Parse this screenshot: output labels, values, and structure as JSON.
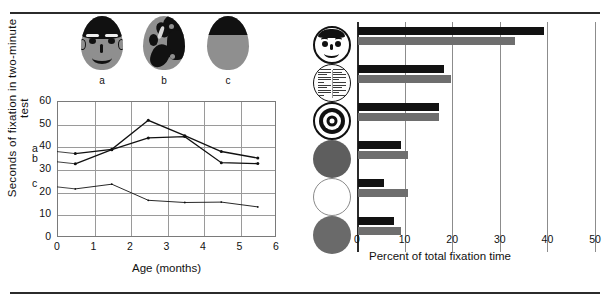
{
  "figure": {
    "left_panel": {
      "stimuli": [
        {
          "id": "a",
          "label": "a",
          "name": "schematic-face"
        },
        {
          "id": "b",
          "label": "b",
          "name": "scrambled-face"
        },
        {
          "id": "c",
          "label": "c",
          "name": "half-black-oval"
        }
      ],
      "series_tags": [
        "a",
        "b",
        "c"
      ]
    },
    "right_panel": {
      "stimuli": [
        {
          "label": "face",
          "name": "line-drawing-face"
        },
        {
          "label": "newsprint",
          "name": "newsprint-circle"
        },
        {
          "label": "bullseye",
          "name": "bullseye-circle"
        },
        {
          "label": "red",
          "name": "plain-red-circle"
        },
        {
          "label": "white",
          "name": "plain-white-circle"
        },
        {
          "label": "yellow",
          "name": "plain-yellow-circle"
        }
      ]
    }
  },
  "chart_data": [
    {
      "type": "line",
      "title": "",
      "xlabel": "Age (months)",
      "ylabel": "Seconds of fixation in two-minute test",
      "xlim": [
        0,
        6
      ],
      "ylim": [
        0,
        60
      ],
      "xticks": [
        0,
        1,
        2,
        3,
        4,
        5,
        6
      ],
      "yticks": [
        0,
        10,
        20,
        30,
        40,
        50,
        60
      ],
      "grid": true,
      "legend_position": "inline-left",
      "x": [
        0.5,
        1.5,
        2.5,
        3.5,
        4.5,
        5.5
      ],
      "series": [
        {
          "name": "a",
          "values": [
            36.8,
            38.7,
            51.5,
            44.7,
            37.7,
            34.8
          ]
        },
        {
          "name": "b",
          "values": [
            32.3,
            38.5,
            43.7,
            44.3,
            32.8,
            32.4
          ]
        },
        {
          "name": "c",
          "values": [
            21.2,
            23.3,
            16.2,
            15.2,
            15.4,
            13.3
          ]
        }
      ]
    },
    {
      "type": "bar",
      "orientation": "horizontal",
      "title": "",
      "xlabel": "Percent of total fixation time",
      "ylabel": "",
      "xlim": [
        0,
        50
      ],
      "xticks": [
        0,
        10,
        20,
        30,
        40,
        50
      ],
      "grid": true,
      "categories": [
        "face",
        "newsprint",
        "bullseye",
        "red",
        "white",
        "yellow"
      ],
      "series": [
        {
          "name": "black-bar",
          "color": "#121212",
          "values": [
            39.0,
            18.0,
            17.0,
            9.0,
            5.5,
            7.5
          ]
        },
        {
          "name": "gray-bar",
          "color": "#6e6e6e",
          "values": [
            33.0,
            19.5,
            17.0,
            10.5,
            10.5,
            9.0
          ]
        }
      ]
    }
  ],
  "colors": {
    "rule": "#2b2b2b",
    "black_bar": "#121212",
    "gray_bar": "#6e6e6e",
    "grid": "#8c8c8c",
    "oval_fill": "#8f8f8f"
  }
}
